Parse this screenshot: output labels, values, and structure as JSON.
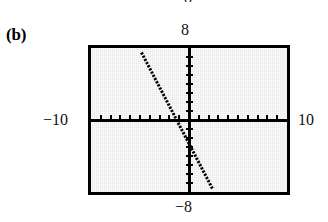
{
  "figure": {
    "label": "(b)",
    "clipped_label_above": "8"
  },
  "window_labels": {
    "x_min": "−10",
    "x_max": "10",
    "y_max": "8",
    "y_min": "−8"
  },
  "colors": {
    "screen_background": "#e9e9e9",
    "frame_border": "#000000",
    "axis": "#000000",
    "plot_line": "#000000",
    "page_background": "#ffffff",
    "text": "#111111"
  },
  "chart_data": {
    "type": "line",
    "title": "",
    "subtitle": "",
    "xlabel": "",
    "ylabel": "",
    "xlim": [
      -10,
      10
    ],
    "ylim": [
      -8,
      8
    ],
    "grid": false,
    "legend_position": "none",
    "axis_style": "graphing-calculator-window-with-tick-marks",
    "x_tick_interval": 1,
    "y_tick_interval": 1,
    "x_ticks": [
      -9,
      -8,
      -7,
      -6,
      -5,
      -4,
      -3,
      -2,
      -1,
      1,
      2,
      3,
      4,
      5,
      6,
      7,
      8,
      9
    ],
    "y_ticks": [
      -7,
      -6,
      -5,
      -4,
      -3,
      -2,
      -1,
      1,
      2,
      3,
      4,
      5,
      6,
      7
    ],
    "series": [
      {
        "name": "line",
        "style": "dotted-pixelated",
        "slope": -2.75,
        "intercept": -1.0,
        "x": [
          -4.85,
          3.15
        ],
        "y": [
          12.3,
          -9.7
        ],
        "x_intercept": -0.36,
        "y_intercept": -1.0,
        "clipped_segment": {
          "x_start": -4.85,
          "y_start": 7.5,
          "x_end": 2.45,
          "y_end": -7.75
        }
      }
    ],
    "annotations": [
      {
        "text": "(b)",
        "position": "outside-left-top"
      },
      {
        "text": "8",
        "position": "above-window"
      },
      {
        "text": "−8",
        "position": "below-window"
      },
      {
        "text": "−10",
        "position": "left-of-window"
      },
      {
        "text": "10",
        "position": "right-of-window"
      }
    ]
  }
}
